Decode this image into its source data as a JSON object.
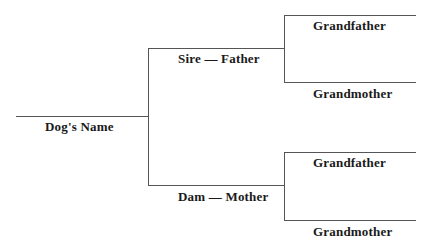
{
  "pedigree": {
    "root": {
      "label": "Dog's Name"
    },
    "sire": {
      "label": "Sire — Father"
    },
    "dam": {
      "label": "Dam — Mother"
    },
    "sire_parents": {
      "grandfather": "Grandfather",
      "grandmother": "Grandmother"
    },
    "dam_parents": {
      "grandfather": "Grandfather",
      "grandmother": "Grandmother"
    }
  },
  "colors": {
    "line": "#555555",
    "text": "#1a1a1a"
  }
}
